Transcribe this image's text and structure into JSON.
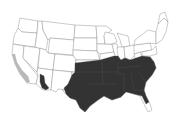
{
  "map": {
    "region": "Contiguous United States",
    "type": "species range map",
    "colors": {
      "background": "#ffffff",
      "state_fill": "#ffffff",
      "state_border": "#8a8a8a",
      "primary_range": "#333333",
      "secondary_range": "#b8b8b8"
    },
    "legend": {
      "primary_range_label": "Primary range (southeastern US and southeastern Arizona)",
      "secondary_range_label": "Secondary range (coastal California)"
    },
    "primary_range_states": [
      "Texas",
      "Oklahoma",
      "Kansas (south)",
      "Missouri",
      "Arkansas",
      "Louisiana",
      "Mississippi",
      "Alabama",
      "Georgia",
      "Florida (excluding southern tip)",
      "Tennessee",
      "Kentucky",
      "South Carolina",
      "North Carolina",
      "Virginia (south)",
      "Illinois (south)",
      "Indiana (south)",
      "Arizona (southeast)"
    ],
    "secondary_range_states": [
      "California (coast)"
    ]
  }
}
